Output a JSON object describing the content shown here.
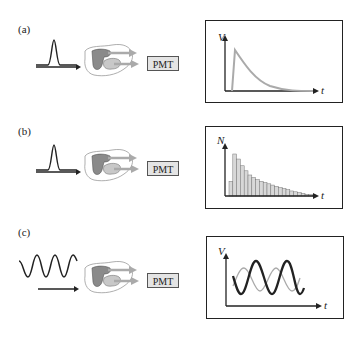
{
  "panels": [
    {
      "id": "a",
      "label": "(a)",
      "input": "pulse",
      "detector": "PMT",
      "output_type": "decay-curve",
      "y_axis": "V",
      "x_axis": "t"
    },
    {
      "id": "b",
      "label": "(b)",
      "input": "pulse",
      "detector": "PMT",
      "output_type": "histogram",
      "y_axis": "N",
      "x_axis": "t"
    },
    {
      "id": "c",
      "label": "(c)",
      "input": "sinusoid",
      "detector": "PMT",
      "output_type": "phase-shifted-sinusoid",
      "y_axis": "V",
      "x_axis": "t"
    }
  ],
  "colors": {
    "line": "#222222",
    "signal_gray": "#aaaaaa",
    "sample_dark": "#8a8a8a",
    "sample_light": "#c8c8c8",
    "pmt_fill": "#e4e4e4"
  },
  "histogram_bars": [
    0.35,
    1.0,
    0.88,
    0.72,
    0.6,
    0.5,
    0.44,
    0.39,
    0.35,
    0.32,
    0.29,
    0.26,
    0.23,
    0.2,
    0.18,
    0.15,
    0.12,
    0.1,
    0.08,
    0.06,
    0.04,
    0.03,
    0.02
  ]
}
